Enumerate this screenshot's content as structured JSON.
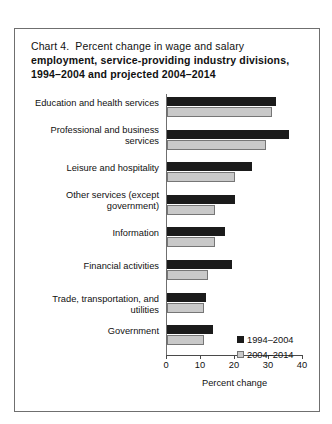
{
  "figure": {
    "chart_number": "Chart 4.",
    "title_lines": [
      "Percent change in wage and salary",
      "employment, service-providing industry divisions,",
      "1994–2004 and projected 2004–2014"
    ]
  },
  "chart_data": {
    "type": "bar",
    "orientation": "horizontal",
    "xlabel": "Percent change",
    "ylabel": "",
    "xlim": [
      0,
      40
    ],
    "xticks": [
      0,
      10,
      20,
      30,
      40
    ],
    "xtick_labels": [
      "0",
      "10",
      "20",
      "30",
      "40"
    ],
    "grid": false,
    "legend_position": "lower right",
    "categories": [
      "Education and health services",
      "Professional and business services",
      "Leisure and hospitality",
      "Other services (except government)",
      "Information",
      "Financial activities",
      "Trade, transportation, and utilities",
      "Government"
    ],
    "category_lines": [
      [
        "Education and health services"
      ],
      [
        "Professional and business",
        "services"
      ],
      [
        "Leisure and hospitality"
      ],
      [
        "Other services (except",
        "government)"
      ],
      [
        "Information"
      ],
      [
        "Financial activities"
      ],
      [
        "Trade, transportation, and utilities"
      ],
      [
        "Government"
      ]
    ],
    "series": [
      {
        "name": "1994–2004",
        "color": "#1b1b1b",
        "values": [
          32,
          36,
          25,
          20,
          17,
          19,
          11.5,
          13.5
        ]
      },
      {
        "name": "2004–2014",
        "color": "#c9c9c9",
        "values": [
          31,
          29,
          20,
          14,
          14,
          12,
          11,
          11
        ]
      }
    ]
  },
  "legend": {
    "entries": [
      {
        "label": "1994–2004",
        "swatch": "dark-square-swatch"
      },
      {
        "label": "2004–2014",
        "swatch": "light-square-swatch"
      }
    ]
  }
}
